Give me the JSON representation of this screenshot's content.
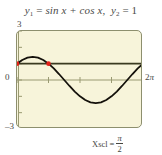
{
  "title": {
    "y1_name": "y",
    "y1_sub": "1",
    "y1_equals": "=",
    "y1_expr": "sin x + cos x",
    "separator": ",",
    "y2_name": "y",
    "y2_sub": "2",
    "y2_equals": "=",
    "y2_expr": "1"
  },
  "axes": {
    "y_max_label": "3",
    "y_zero_label": "0",
    "y_min_label": "–3",
    "x_max_label_num": "2",
    "x_max_label_sym": "π"
  },
  "caption": {
    "label": "Xscl",
    "equals": "=",
    "numerator": "π",
    "denominator": "2"
  },
  "colors": {
    "plot_background": "#f7f4da",
    "frame_border": "#8d8f6e",
    "curve": "#14110b",
    "line_y2": "#3a3a20",
    "axis": "#9a9a72",
    "intersection_point": "#e32118",
    "text": "#46463f"
  },
  "chart_data": {
    "type": "line",
    "xlabel": "",
    "ylabel": "",
    "xlim": [
      0,
      6.283185307179586
    ],
    "ylim": [
      -3,
      3
    ],
    "xscl": 1.5707963267948966,
    "yscl": 1,
    "grid": false,
    "legend": false,
    "x_tick_labels": [
      "2π"
    ],
    "y_tick_labels": [
      "3",
      "0",
      "–3"
    ],
    "series": [
      {
        "name": "y1 = sin x + cos x",
        "type": "curve",
        "color": "#14110b",
        "x": [
          0,
          0.2617993878,
          0.5235987756,
          0.7853981634,
          1.0471975512,
          1.3089969389,
          1.5707963268,
          1.8325957146,
          2.0943951024,
          2.3561944902,
          2.617993878,
          2.8797932658,
          3.1415926536,
          3.4033920413,
          3.6651914291,
          3.9269908169,
          4.1887902047,
          4.4505895925,
          4.7123889804,
          4.9741883681,
          5.235987756,
          5.4977871438,
          5.7595865316,
          6.0213859193,
          6.2831853072
        ],
        "y": [
          1.0,
          1.2247,
          1.366,
          1.4142,
          1.366,
          1.2247,
          1.0,
          0.7071,
          0.366,
          0.0,
          -0.366,
          -0.7071,
          -1.0,
          -1.2247,
          -1.366,
          -1.4142,
          -1.366,
          -1.2247,
          -1.0,
          -0.7071,
          -0.366,
          0.0,
          0.366,
          0.7071,
          1.0
        ]
      },
      {
        "name": "y2 = 1",
        "type": "horizontal-line",
        "color": "#3a3a20",
        "value": 1
      }
    ],
    "intersection_points": [
      {
        "x": 0,
        "y": 1,
        "label": "x = 0"
      },
      {
        "x": 1.5707963268,
        "y": 1,
        "label": "x = π/2"
      }
    ],
    "annotations": [
      "Xscl = π/2"
    ]
  }
}
